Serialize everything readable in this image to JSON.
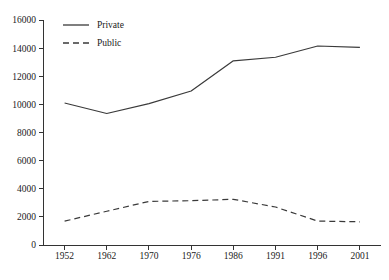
{
  "chart_data": {
    "type": "line",
    "title": "",
    "xlabel": "",
    "ylabel": "",
    "categories": [
      "1952",
      "1962",
      "1970",
      "1976",
      "1986",
      "1991",
      "1996",
      "2001"
    ],
    "x": [
      1952,
      1962,
      1970,
      1976,
      1986,
      1991,
      1996,
      2001
    ],
    "series": [
      {
        "name": "Private",
        "style": "solid",
        "color": "#3a3a3a",
        "values": [
          10100,
          9350,
          10050,
          10950,
          13100,
          13350,
          14150,
          14050
        ]
      },
      {
        "name": "Public",
        "style": "dashed",
        "color": "#3a3a3a",
        "values": [
          1700,
          2400,
          3100,
          3150,
          3250,
          2700,
          1700,
          1650
        ]
      }
    ],
    "ylim": [
      0,
      16000
    ],
    "ytick_values": [
      0,
      2000,
      4000,
      6000,
      8000,
      10000,
      12000,
      14000,
      16000
    ],
    "ytick_labels": [
      "0",
      "2000",
      "4000",
      "6000",
      "8000",
      "10000",
      "12000",
      "14000",
      "16000"
    ],
    "grid": false,
    "legend_position": "top-left",
    "legend_entries": [
      "Private",
      "Public"
    ]
  },
  "caption": {
    "text": ""
  }
}
